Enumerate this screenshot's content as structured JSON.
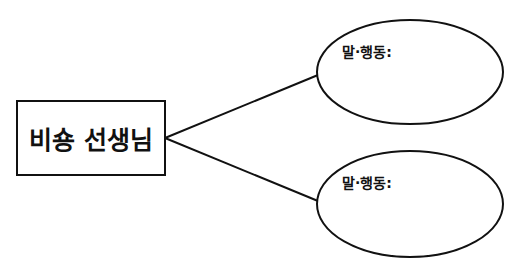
{
  "diagram": {
    "center_node": {
      "label": "비숑 선생님"
    },
    "branches": [
      {
        "label": "말·행동:"
      },
      {
        "label": "말·행동:"
      }
    ],
    "colors": {
      "stroke": "#111111",
      "background": "#ffffff"
    }
  }
}
